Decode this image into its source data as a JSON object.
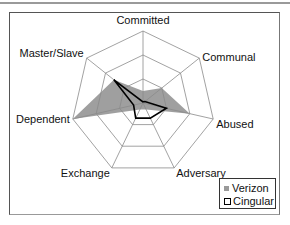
{
  "chart_data": {
    "type": "radar",
    "title": "",
    "axes": [
      "Committed",
      "Communal",
      "Abused",
      "Adversary",
      "Exchange",
      "Dependent",
      "Master/Slave"
    ],
    "rings": 3,
    "range": [
      0,
      3
    ],
    "series": [
      {
        "name": "Verizon",
        "style": "filled",
        "color": "#9a9a9a",
        "values": [
          0.5,
          1.0,
          2.0,
          0.3,
          0.3,
          3.0,
          1.55
        ]
      },
      {
        "name": "Cingular",
        "style": "line",
        "color": "#000000",
        "values": [
          0.05,
          0.1,
          1.0,
          0.7,
          0.7,
          0.4,
          1.55
        ]
      }
    ],
    "legend_position": "bottom-right"
  },
  "legend": {
    "items": [
      {
        "label": "Verizon"
      },
      {
        "label": "Cingular"
      }
    ]
  }
}
